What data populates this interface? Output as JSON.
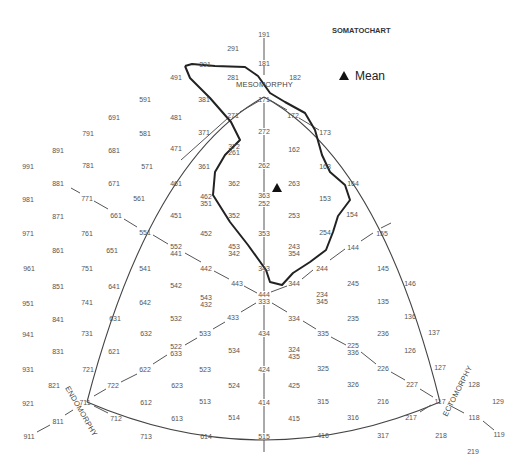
{
  "chart_data": {
    "type": "scatter",
    "title": "SOMATOCHART",
    "legend": [
      {
        "label": "Mean",
        "marker": "filled-triangle",
        "color": "#111111"
      }
    ],
    "axes": {
      "mesomorphy": {
        "label": "MESOMORPHY",
        "position": "top"
      },
      "endomorphy": {
        "label": "ENDOMORPHY",
        "position": "bottom-left"
      },
      "ectomorphy": {
        "label": "ECTOMORPHY",
        "position": "bottom-right"
      }
    },
    "mean_point": {
      "x": 277,
      "y": 188,
      "label": "Mean"
    },
    "somatotype_labels": [
      {
        "t": "191",
        "x": 264,
        "y": 34
      },
      {
        "t": "291",
        "x": 233,
        "y": 48
      },
      {
        "t": "181",
        "x": 264,
        "y": 63
      },
      {
        "t": "391",
        "x": 205,
        "y": 64
      },
      {
        "t": "182",
        "x": 295,
        "y": 77
      },
      {
        "t": "281",
        "x": 233,
        "y": 77
      },
      {
        "t": "491",
        "x": 176,
        "y": 77
      },
      {
        "t": "171",
        "x": 264,
        "y": 99
      },
      {
        "t": "591",
        "x": 145,
        "y": 99
      },
      {
        "t": "381",
        "x": 204,
        "y": 99
      },
      {
        "t": "172",
        "x": 293,
        "y": 115
      },
      {
        "t": "271",
        "x": 233,
        "y": 115
      },
      {
        "t": "691",
        "x": 114,
        "y": 117
      },
      {
        "t": "481",
        "x": 176,
        "y": 117
      },
      {
        "t": "173",
        "x": 325,
        "y": 132
      },
      {
        "t": "272",
        "x": 264,
        "y": 131
      },
      {
        "t": "371",
        "x": 204,
        "y": 132
      },
      {
        "t": "791",
        "x": 88,
        "y": 133
      },
      {
        "t": "581",
        "x": 145,
        "y": 133
      },
      {
        "t": "162",
        "x": 294,
        "y": 149
      },
      {
        "t": "372",
        "x": 234,
        "y": 146
      },
      {
        "t": "361b",
        "d": "261",
        "x": 234,
        "y": 152
      },
      {
        "t": "891",
        "x": 58,
        "y": 150
      },
      {
        "t": "681",
        "x": 114,
        "y": 150
      },
      {
        "t": "471",
        "x": 176,
        "y": 148
      },
      {
        "t": "163",
        "x": 325,
        "y": 166
      },
      {
        "t": "262",
        "x": 264,
        "y": 165
      },
      {
        "t": "361",
        "x": 204,
        "y": 166
      },
      {
        "t": "991",
        "x": 28,
        "y": 166
      },
      {
        "t": "781",
        "x": 88,
        "y": 165
      },
      {
        "t": "571",
        "x": 147,
        "y": 166
      },
      {
        "t": "263",
        "x": 294,
        "y": 183
      },
      {
        "t": "164",
        "x": 353,
        "y": 183
      },
      {
        "t": "362",
        "x": 234,
        "y": 183
      },
      {
        "t": "461",
        "x": 176,
        "y": 183
      },
      {
        "t": "671",
        "x": 114,
        "y": 183
      },
      {
        "t": "881",
        "x": 58,
        "y": 183
      },
      {
        "t": "363",
        "x": 264,
        "y": 195
      },
      {
        "t": "252",
        "x": 264,
        "y": 203
      },
      {
        "t": "153",
        "x": 325,
        "y": 198
      },
      {
        "t": "462",
        "x": 206,
        "y": 196
      },
      {
        "t": "351",
        "x": 206,
        "y": 203
      },
      {
        "t": "561",
        "x": 139,
        "y": 198
      },
      {
        "t": "771",
        "x": 87,
        "y": 198
      },
      {
        "t": "981",
        "x": 28,
        "y": 199
      },
      {
        "t": "154",
        "x": 352,
        "y": 214
      },
      {
        "t": "253",
        "x": 294,
        "y": 215
      },
      {
        "t": "352",
        "x": 234,
        "y": 215
      },
      {
        "t": "451",
        "x": 176,
        "y": 215
      },
      {
        "t": "661",
        "x": 116,
        "y": 215
      },
      {
        "t": "871",
        "x": 58,
        "y": 216
      },
      {
        "t": "155",
        "x": 382,
        "y": 233
      },
      {
        "t": "254",
        "x": 325,
        "y": 232
      },
      {
        "t": "353",
        "x": 264,
        "y": 233
      },
      {
        "t": "452",
        "x": 206,
        "y": 233
      },
      {
        "t": "551",
        "x": 145,
        "y": 232
      },
      {
        "t": "761",
        "x": 87,
        "y": 233
      },
      {
        "t": "971",
        "x": 28,
        "y": 233
      },
      {
        "t": "144",
        "x": 353,
        "y": 247
      },
      {
        "t": "243",
        "x": 294,
        "y": 246
      },
      {
        "t": "354",
        "x": 294,
        "y": 253
      },
      {
        "t": "453",
        "x": 234,
        "y": 246
      },
      {
        "t": "342",
        "x": 234,
        "y": 253
      },
      {
        "t": "552",
        "x": 176,
        "y": 246
      },
      {
        "t": "441",
        "x": 176,
        "y": 253
      },
      {
        "t": "651",
        "x": 112,
        "y": 250
      },
      {
        "t": "861",
        "x": 58,
        "y": 250
      },
      {
        "t": "343",
        "x": 264,
        "y": 268
      },
      {
        "t": "244",
        "x": 322,
        "y": 268
      },
      {
        "t": "145",
        "x": 383,
        "y": 268
      },
      {
        "t": "442",
        "x": 206,
        "y": 268
      },
      {
        "t": "541",
        "x": 145,
        "y": 268
      },
      {
        "t": "751",
        "x": 87,
        "y": 268
      },
      {
        "t": "961",
        "x": 29,
        "y": 268
      },
      {
        "t": "344",
        "x": 294,
        "y": 283
      },
      {
        "t": "245",
        "x": 353,
        "y": 283
      },
      {
        "t": "146",
        "x": 410,
        "y": 283
      },
      {
        "t": "443",
        "x": 237,
        "y": 283
      },
      {
        "t": "542",
        "x": 176,
        "y": 285
      },
      {
        "t": "641",
        "x": 114,
        "y": 286
      },
      {
        "t": "851",
        "x": 58,
        "y": 286
      },
      {
        "t": "444",
        "x": 264,
        "y": 294
      },
      {
        "t": "333",
        "x": 264,
        "y": 301
      },
      {
        "t": "234",
        "x": 322,
        "y": 294
      },
      {
        "t": "345",
        "x": 322,
        "y": 301
      },
      {
        "t": "135",
        "x": 383,
        "y": 301
      },
      {
        "t": "543",
        "x": 206,
        "y": 297
      },
      {
        "t": "432",
        "x": 206,
        "y": 304
      },
      {
        "t": "642",
        "x": 145,
        "y": 302
      },
      {
        "t": "741",
        "x": 87,
        "y": 302
      },
      {
        "t": "951",
        "x": 28,
        "y": 303
      },
      {
        "t": "334",
        "x": 294,
        "y": 318
      },
      {
        "t": "235",
        "x": 353,
        "y": 318
      },
      {
        "t": "136",
        "x": 410,
        "y": 316
      },
      {
        "t": "433",
        "x": 233,
        "y": 317
      },
      {
        "t": "532",
        "x": 176,
        "y": 318
      },
      {
        "t": "631",
        "x": 115,
        "y": 318
      },
      {
        "t": "841",
        "x": 58,
        "y": 319
      },
      {
        "t": "434",
        "x": 264,
        "y": 333
      },
      {
        "t": "335",
        "x": 323,
        "y": 333
      },
      {
        "t": "236",
        "x": 383,
        "y": 333
      },
      {
        "t": "137",
        "x": 434,
        "y": 332
      },
      {
        "t": "533",
        "x": 205,
        "y": 333
      },
      {
        "t": "632",
        "x": 146,
        "y": 333
      },
      {
        "t": "731",
        "x": 87,
        "y": 333
      },
      {
        "t": "941",
        "x": 28,
        "y": 334
      },
      {
        "t": "324",
        "x": 294,
        "y": 349
      },
      {
        "t": "435",
        "x": 294,
        "y": 356
      },
      {
        "t": "225",
        "x": 353,
        "y": 345
      },
      {
        "t": "336",
        "x": 353,
        "y": 352
      },
      {
        "t": "126",
        "x": 410,
        "y": 350
      },
      {
        "t": "534",
        "x": 234,
        "y": 350
      },
      {
        "t": "522",
        "x": 176,
        "y": 346
      },
      {
        "t": "633",
        "x": 176,
        "y": 353
      },
      {
        "t": "621",
        "x": 114,
        "y": 351
      },
      {
        "t": "831",
        "x": 58,
        "y": 351
      },
      {
        "t": "424",
        "x": 264,
        "y": 369
      },
      {
        "t": "325",
        "x": 323,
        "y": 368
      },
      {
        "t": "226",
        "x": 383,
        "y": 368
      },
      {
        "t": "127",
        "x": 440,
        "y": 367
      },
      {
        "t": "523",
        "x": 205,
        "y": 369
      },
      {
        "t": "622",
        "x": 145,
        "y": 369
      },
      {
        "t": "721",
        "x": 88,
        "y": 369
      },
      {
        "t": "931",
        "x": 28,
        "y": 369
      },
      {
        "t": "425",
        "x": 294,
        "y": 385
      },
      {
        "t": "326",
        "x": 353,
        "y": 384
      },
      {
        "t": "227",
        "x": 412,
        "y": 384
      },
      {
        "t": "128",
        "x": 474,
        "y": 384
      },
      {
        "t": "524",
        "x": 234,
        "y": 385
      },
      {
        "t": "623",
        "x": 177,
        "y": 385
      },
      {
        "t": "722",
        "x": 113,
        "y": 385
      },
      {
        "t": "821",
        "x": 54,
        "y": 385
      },
      {
        "t": "414",
        "x": 264,
        "y": 402
      },
      {
        "t": "315",
        "x": 323,
        "y": 401
      },
      {
        "t": "216",
        "x": 383,
        "y": 401
      },
      {
        "t": "117",
        "x": 440,
        "y": 401
      },
      {
        "t": "129",
        "x": 498,
        "y": 401
      },
      {
        "t": "513",
        "x": 205,
        "y": 401
      },
      {
        "t": "612",
        "x": 146,
        "y": 402
      },
      {
        "t": "711",
        "x": 85,
        "y": 402
      },
      {
        "t": "921",
        "x": 28,
        "y": 403
      },
      {
        "t": "415",
        "x": 294,
        "y": 418
      },
      {
        "t": "316",
        "x": 353,
        "y": 417
      },
      {
        "t": "217",
        "x": 411,
        "y": 417
      },
      {
        "t": "118",
        "x": 474,
        "y": 417
      },
      {
        "t": "514",
        "x": 234,
        "y": 417
      },
      {
        "t": "613",
        "x": 177,
        "y": 418
      },
      {
        "t": "712",
        "x": 116,
        "y": 418
      },
      {
        "t": "811",
        "x": 58,
        "y": 421
      },
      {
        "t": "515",
        "x": 264,
        "y": 436
      },
      {
        "t": "416",
        "x": 323,
        "y": 435
      },
      {
        "t": "317",
        "x": 383,
        "y": 435
      },
      {
        "t": "218",
        "x": 441,
        "y": 435
      },
      {
        "t": "119",
        "x": 499,
        "y": 434
      },
      {
        "t": "614",
        "x": 206,
        "y": 436
      },
      {
        "t": "713",
        "x": 146,
        "y": 436
      },
      {
        "t": "911",
        "x": 29,
        "y": 436
      },
      {
        "t": "219",
        "x": 473,
        "y": 451
      }
    ],
    "distribution_outline": [
      [
        185,
        66
      ],
      [
        192,
        64
      ],
      [
        215,
        66
      ],
      [
        245,
        67
      ],
      [
        258,
        76
      ],
      [
        270,
        93
      ],
      [
        285,
        102
      ],
      [
        305,
        113
      ],
      [
        315,
        130
      ],
      [
        322,
        155
      ],
      [
        330,
        172
      ],
      [
        345,
        185
      ],
      [
        350,
        200
      ],
      [
        338,
        216
      ],
      [
        333,
        232
      ],
      [
        326,
        250
      ],
      [
        310,
        262
      ],
      [
        293,
        273
      ],
      [
        282,
        285
      ],
      [
        270,
        282
      ],
      [
        266,
        270
      ],
      [
        248,
        245
      ],
      [
        230,
        222
      ],
      [
        213,
        195
      ],
      [
        215,
        172
      ],
      [
        225,
        155
      ],
      [
        240,
        140
      ],
      [
        231,
        122
      ],
      [
        210,
        98
      ],
      [
        190,
        78
      ],
      [
        185,
        66
      ]
    ]
  },
  "labels": {
    "title": "SOMATOCHART",
    "legend_mean": "Mean",
    "mesomorphy": "MESOMORPHY",
    "endomorphy": "ENDOMORPHY",
    "ectomorphy": "ECTOMORPHY"
  },
  "colors": {
    "text": "#555555",
    "lines": "#555555",
    "outline": "#222222",
    "marker": "#111111",
    "background": "#ffffff"
  }
}
